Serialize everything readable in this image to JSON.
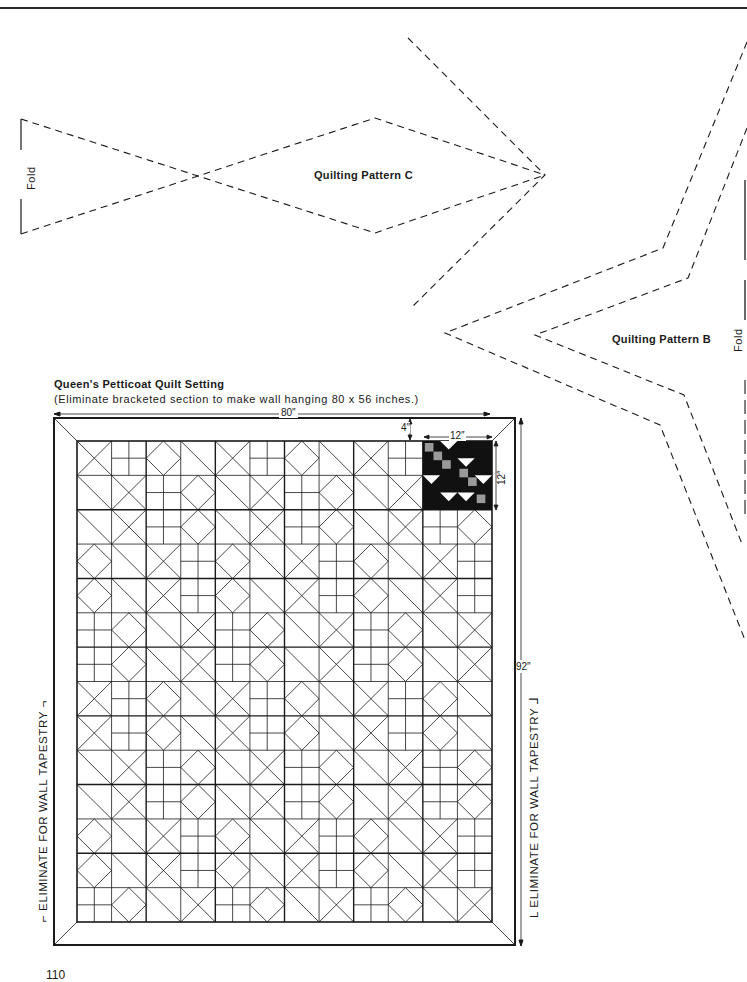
{
  "page": {
    "page_number": "110"
  },
  "pattern_c": {
    "title": "Quilting Pattern C",
    "fold_label": "Fold"
  },
  "pattern_b": {
    "title": "Quilting Pattern B",
    "fold_label": "Fold"
  },
  "quilt_setting": {
    "title": "Queen's Petticoat Quilt Setting",
    "subtitle": "(Eliminate bracketed section to make wall hanging 80 x 56 inches.)",
    "dimensions": {
      "width": "80″",
      "height": "92″",
      "border": "4″",
      "block_width": "12″",
      "block_height": "12″"
    },
    "bracket_left": "ELIMINATE FOR WALL TAPESTRY",
    "bracket_right": "ELIMINATE FOR WALL TAPESTRY",
    "grid": {
      "columns": 6,
      "rows": 7,
      "subdivisions": 2
    }
  },
  "colors": {
    "ink": "#1a1a1a",
    "paper": "#ffffff"
  }
}
